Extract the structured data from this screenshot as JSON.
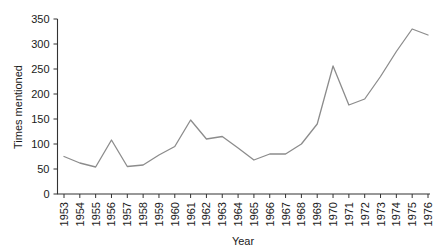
{
  "chart_data": {
    "type": "line",
    "title": "",
    "subtitle": "",
    "xlabel": "Year",
    "ylabel": "Times mentioned",
    "categories": [
      "1953",
      "1954",
      "1955",
      "1956",
      "1957",
      "1958",
      "1959",
      "1960",
      "1961",
      "1962",
      "1963",
      "1964",
      "1965",
      "1966",
      "1967",
      "1968",
      "1969",
      "1970",
      "1971",
      "1972",
      "1973",
      "1974",
      "1975",
      "1976"
    ],
    "values": [
      75,
      62,
      54,
      108,
      55,
      58,
      78,
      95,
      148,
      110,
      115,
      92,
      68,
      80,
      80,
      100,
      140,
      256,
      178,
      190,
      235,
      285,
      330,
      318
    ],
    "series": [
      {
        "name": "Times mentioned",
        "values": [
          75,
          62,
          54,
          108,
          55,
          58,
          78,
          95,
          148,
          110,
          115,
          92,
          68,
          80,
          80,
          100,
          140,
          256,
          178,
          190,
          235,
          285,
          330,
          318
        ]
      }
    ],
    "ylim": [
      0,
      350
    ],
    "yticks": [
      0,
      50,
      100,
      150,
      200,
      250,
      300,
      350
    ],
    "ytick_labels": [
      "0",
      "50",
      "100",
      "150",
      "200",
      "250",
      "300",
      "350"
    ],
    "xtick_labels": [
      "1953",
      "1954",
      "1955",
      "1956",
      "1957",
      "1958",
      "1959",
      "1960",
      "1961",
      "1962",
      "1963",
      "1964",
      "1965",
      "1966",
      "1967",
      "1968",
      "1969",
      "1970",
      "1971",
      "1972",
      "1973",
      "1974",
      "1975",
      "1976"
    ],
    "xtick_rotation": 90,
    "grid": false,
    "legend": false,
    "legend_position": "none",
    "line_color": "#8c8c8c",
    "axis_color": "#333333",
    "background_color": "#ffffff",
    "annotations": []
  },
  "axes": {
    "y_title": "Times mentioned",
    "x_title": "Year"
  }
}
